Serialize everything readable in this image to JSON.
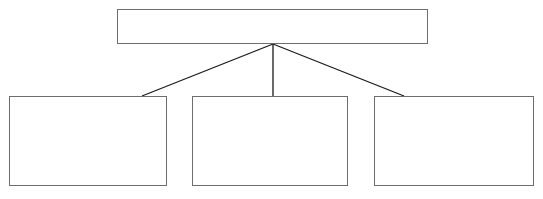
{
  "diagram": {
    "type": "hierarchy-tree",
    "orientation": "top-down",
    "levels": 2,
    "background_color": "#ffffff",
    "box_border_color": "#6e6e6e",
    "box_fill_color": "#ffffff",
    "connector_color": "#1a1a1a",
    "box_border_width_px": 1,
    "connector_width_px": 1,
    "canvas": {
      "width": 543,
      "height": 199
    },
    "nodes": {
      "root": {
        "label": "",
        "x": 117,
        "y": 9,
        "width": 311,
        "height": 35
      },
      "children": [
        {
          "label": "",
          "x": 9,
          "y": 96,
          "width": 158,
          "height": 90
        },
        {
          "label": "",
          "x": 192,
          "y": 96,
          "width": 156,
          "height": 90
        },
        {
          "label": "",
          "x": 374,
          "y": 96,
          "width": 160,
          "height": 90
        }
      ]
    },
    "connectors": [
      {
        "name": "root-to-left",
        "x1": 273,
        "y1": 44,
        "x2": 142,
        "y2": 96
      },
      {
        "name": "root-to-middle",
        "x1": 273,
        "y1": 44,
        "x2": 273,
        "y2": 96
      },
      {
        "name": "root-to-right",
        "x1": 273,
        "y1": 44,
        "x2": 404,
        "y2": 96
      }
    ]
  }
}
